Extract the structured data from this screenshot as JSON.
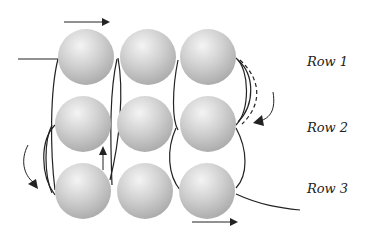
{
  "diagram": {
    "type": "beading-thread-path",
    "grid": {
      "rows": 3,
      "cols": 3
    },
    "bead_color": "#c8c8c8",
    "thread_color": "#222222",
    "row_labels": [
      "Row 1",
      "Row 2",
      "Row 3"
    ],
    "arrows": [
      {
        "id": "top-right-arrow",
        "direction": "right"
      },
      {
        "id": "right-curved-arrow",
        "direction": "down-left"
      },
      {
        "id": "left-curved-arrow",
        "direction": "down-right"
      },
      {
        "id": "up-arrow",
        "direction": "up"
      },
      {
        "id": "bottom-right-arrow",
        "direction": "right"
      }
    ]
  }
}
